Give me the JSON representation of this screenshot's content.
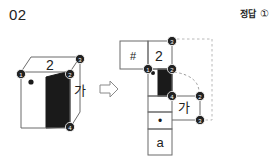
{
  "problem": {
    "number": "02",
    "answer_label": "정답",
    "answer_choice": "①"
  },
  "cube": {
    "face_top_label": "2",
    "face_right_label": "가",
    "vertices": [
      "1",
      "2",
      "3",
      "4"
    ],
    "shaded_face_color": "#1a1a1a",
    "dot_marker": "•"
  },
  "net": {
    "cells": [
      {
        "label": "#"
      },
      {
        "label": "2"
      },
      {
        "label": ""
      },
      {
        "label": "가"
      },
      {
        "label": "•"
      },
      {
        "label": "a"
      }
    ],
    "vertices": [
      "1",
      "2",
      "3",
      "4",
      "2",
      "3"
    ],
    "shaded_face_color": "#1a1a1a"
  },
  "arrow": {
    "glyph": "⇨",
    "direction": "right"
  },
  "colors": {
    "stroke": "#6b6b6b",
    "dark": "#1a1a1a",
    "dashed": "#b0b0b0",
    "text": "#222222"
  }
}
